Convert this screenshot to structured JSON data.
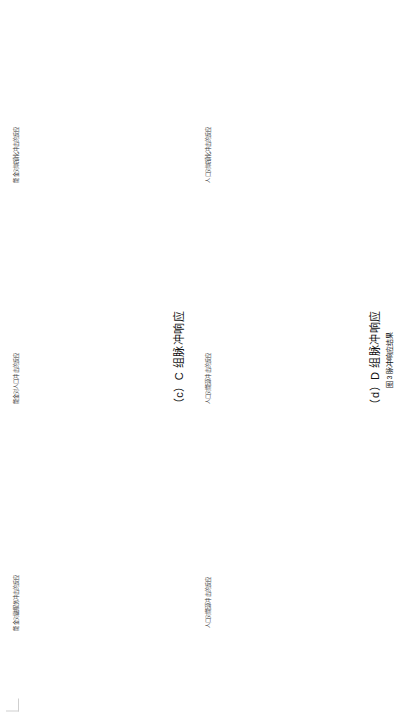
{
  "page": {
    "corner_mark": "crop-mark",
    "figure_caption": "图 3 脉冲响应结果"
  },
  "common": {
    "ylabel": "单位：标准差（%）",
    "xlabel": "时期",
    "legend": {
      "ci": "95% 的置信区间",
      "irf": "脉冲方程"
    },
    "xticks": [
      "0",
      "5",
      "10"
    ]
  },
  "groups": [
    {
      "id": "c",
      "title": "（c）C 组脉冲响应",
      "panels": [
        {
          "num": "①",
          "title": "能金对融服务冲击的反应",
          "yticks": [
            "0.01",
            "0.005",
            "0",
            "-0.005"
          ],
          "ylim": [
            -0.006,
            0.012
          ]
        },
        {
          "num": "②",
          "title": "能金对人口冲击的反应",
          "yticks": [
            "0.02",
            "0.01",
            "0",
            "-0.01"
          ],
          "ylim": [
            -0.012,
            0.023
          ]
        },
        {
          "num": "③",
          "title": "能金对城镇化冲击的反应",
          "yticks": [
            "0.01",
            "0",
            "-0.01"
          ],
          "ylim": [
            -0.012,
            0.013
          ]
        }
      ]
    },
    {
      "id": "d",
      "title": "（d）D 组脉冲响应",
      "panels": [
        {
          "num": "①",
          "title": "人口对能源冲击的反应",
          "yticks": [
            "0.002",
            "0",
            "-0.002",
            "-0.004",
            "-0.006"
          ],
          "ylim": [
            -0.0065,
            0.0025
          ]
        },
        {
          "num": "②",
          "title": "人口对能源冲击的反应",
          "yticks": [
            "0.002",
            "0.0015",
            "0.001",
            "0.0005",
            "0"
          ],
          "ylim": [
            -0.0002,
            0.0022
          ]
        },
        {
          "num": "③",
          "title": "人口对城镇化冲击的反应",
          "yticks": [
            "0.004",
            "0.002",
            "0"
          ],
          "ylim": [
            -0.0004,
            0.0045
          ]
        }
      ]
    }
  ],
  "chart_data": {
    "type": "line",
    "title": "图 3 脉冲响应结果",
    "xlabel": "时期",
    "ylabel": "单位：标准差（%）",
    "x": [
      0,
      1,
      2,
      3,
      4,
      5,
      6,
      7,
      8,
      9,
      10
    ],
    "legend_position": "upper-right",
    "grid": false,
    "panels": [
      {
        "panel_id": "c1",
        "group": "（c）C 组脉冲响应",
        "number": "①",
        "title": "能金对融服务冲击的反应",
        "ylim": [
          -0.006,
          0.012
        ],
        "yticks": [
          0.01,
          0.005,
          0,
          -0.005
        ],
        "xlim": [
          0,
          10
        ],
        "series": [
          {
            "name": "脉冲方程",
            "style": "solid",
            "values": [
              -0.005,
              0.0035,
              0.0042,
              0.004,
              0.0038,
              0.0037,
              0.0036,
              0.0036,
              0.0035,
              0.0035,
              0.0035
            ]
          },
          {
            "name": "95% 的置信区间 上限",
            "style": "dashed",
            "values": [
              -0.0015,
              0.0085,
              0.0082,
              0.0074,
              0.007,
              0.0068,
              0.0066,
              0.0065,
              0.0064,
              0.0064,
              0.0063
            ]
          },
          {
            "name": "95% 的置信区间 下限",
            "style": "dashed",
            "values": [
              -0.006,
              -0.001,
              0.0005,
              0.0008,
              0.0009,
              0.0009,
              0.001,
              0.001,
              0.001,
              0.001,
              0.001
            ]
          }
        ]
      },
      {
        "panel_id": "c2",
        "group": "（c）C 组脉冲响应",
        "number": "②",
        "title": "能金对人口冲击的反应",
        "ylim": [
          -0.012,
          0.023
        ],
        "yticks": [
          0.02,
          0.01,
          0,
          -0.01
        ],
        "xlim": [
          0,
          10
        ],
        "series": [
          {
            "name": "脉冲方程",
            "style": "solid",
            "values": [
              -0.01,
              0.0005,
              0.0035,
              0.0048,
              0.0055,
              0.0058,
              0.006,
              0.0061,
              0.0062,
              0.0062,
              0.0063
            ]
          },
          {
            "name": "95% 的置信区间 上限",
            "style": "dashed",
            "values": [
              -0.006,
              0.006,
              0.0092,
              0.0105,
              0.0112,
              0.0116,
              0.0118,
              0.012,
              0.0121,
              0.0122,
              0.0122
            ]
          },
          {
            "name": "95% 的置信区间 下限",
            "style": "dashed",
            "values": [
              -0.0115,
              -0.0042,
              -0.0015,
              -0.0005,
              0.0,
              0.0002,
              0.0003,
              0.0004,
              0.0004,
              0.0005,
              0.0005
            ]
          }
        ]
      },
      {
        "panel_id": "c3",
        "group": "（c）C 组脉冲响应",
        "number": "③",
        "title": "能金对城镇化冲击的反应",
        "ylim": [
          -0.012,
          0.013
        ],
        "yticks": [
          0.01,
          0,
          -0.01
        ],
        "xlim": [
          0,
          10
        ],
        "series": [
          {
            "name": "脉冲方程",
            "style": "solid",
            "values": [
              -0.011,
              0.0055,
              0.003,
              0.0022,
              0.0018,
              0.0016,
              0.0015,
              0.0014,
              0.0014,
              0.0013,
              0.0013
            ]
          },
          {
            "name": "95% 的置信区间 上限",
            "style": "dashed",
            "values": [
              -0.0065,
              0.0105,
              0.0068,
              0.0055,
              0.005,
              0.0047,
              0.0046,
              0.0045,
              0.0044,
              0.0044,
              0.0043
            ]
          },
          {
            "name": "95% 的置信区间 下限",
            "style": "dashed",
            "values": [
              -0.012,
              0.0005,
              -0.0008,
              -0.001,
              -0.0012,
              -0.0013,
              -0.0014,
              -0.0014,
              -0.0015,
              -0.0015,
              -0.0015
            ]
          }
        ]
      },
      {
        "panel_id": "d1",
        "group": "（d）D 组脉冲响应",
        "number": "①",
        "title": "人口对能源冲击的反应",
        "ylim": [
          -0.0065,
          0.0025
        ],
        "yticks": [
          0.002,
          0,
          -0.002,
          -0.004,
          -0.006
        ],
        "xlim": [
          0,
          10
        ],
        "series": [
          {
            "name": "脉冲方程",
            "style": "solid",
            "values": [
              -0.006,
              -0.0025,
              -0.0012,
              -0.0006,
              -0.0003,
              -0.0001,
              0.0,
              0.0001,
              0.0001,
              0.0002,
              0.0002
            ]
          },
          {
            "name": "95% 的置信区间 上限",
            "style": "dashed",
            "values": [
              -0.005,
              -0.0005,
              0.0006,
              0.0012,
              0.0015,
              0.0017,
              0.0018,
              0.0019,
              0.0019,
              0.002,
              0.002
            ]
          },
          {
            "name": "95% 的置信区间 下限",
            "style": "dashed",
            "values": [
              -0.0063,
              -0.0045,
              -0.0032,
              -0.0025,
              -0.0022,
              -0.002,
              -0.0019,
              -0.0018,
              -0.0018,
              -0.0017,
              -0.0017
            ]
          }
        ]
      },
      {
        "panel_id": "d2",
        "group": "（d）D 组脉冲响应",
        "number": "②",
        "title": "人口对能源冲击的反应",
        "ylim": [
          -0.0002,
          0.0022
        ],
        "yticks": [
          0.002,
          0.0015,
          0.001,
          0.0005,
          0
        ],
        "xlim": [
          0,
          10
        ],
        "series": [
          {
            "name": "脉冲方程",
            "style": "solid",
            "values": [
              0.0,
              0.0006,
              0.0009,
              0.0011,
              0.0012,
              0.0013,
              0.0013,
              0.0014,
              0.0014,
              0.0014,
              0.0015
            ]
          },
          {
            "name": "95% 的置信区间 上限",
            "style": "dashed",
            "values": [
              0.0,
              0.0011,
              0.0015,
              0.0017,
              0.0019,
              0.002,
              0.002,
              0.0021,
              0.0021,
              0.0021,
              0.0022
            ]
          },
          {
            "name": "95% 的置信区间 下限",
            "style": "dashed",
            "values": [
              0.0,
              0.0002,
              0.0004,
              0.0005,
              0.0006,
              0.0006,
              0.0007,
              0.0007,
              0.0007,
              0.0008,
              0.0008
            ]
          }
        ]
      },
      {
        "panel_id": "d3",
        "group": "（d）D 组脉冲响应",
        "number": "③",
        "title": "人口对城镇化冲击的反应",
        "ylim": [
          -0.0004,
          0.0045
        ],
        "yticks": [
          0.004,
          0.002,
          0
        ],
        "xlim": [
          0,
          10
        ],
        "series": [
          {
            "name": "脉冲方程",
            "style": "solid",
            "values": [
              0.0,
              0.0018,
              0.0029,
              0.0033,
              0.0035,
              0.0036,
              0.0036,
              0.0037,
              0.0037,
              0.0037,
              0.0037
            ]
          },
          {
            "name": "95% 的置信区间 上限",
            "style": "dashed",
            "values": [
              0.0,
              0.003,
              0.0039,
              0.0041,
              0.0042,
              0.0042,
              0.0043,
              0.0043,
              0.0043,
              0.0043,
              0.0043
            ]
          },
          {
            "name": "95% 的置信区间 下限",
            "style": "dashed",
            "values": [
              0.0,
              0.0007,
              0.0017,
              0.0023,
              0.0026,
              0.0028,
              0.0029,
              0.003,
              0.003,
              0.0031,
              0.0031
            ]
          }
        ]
      }
    ]
  }
}
